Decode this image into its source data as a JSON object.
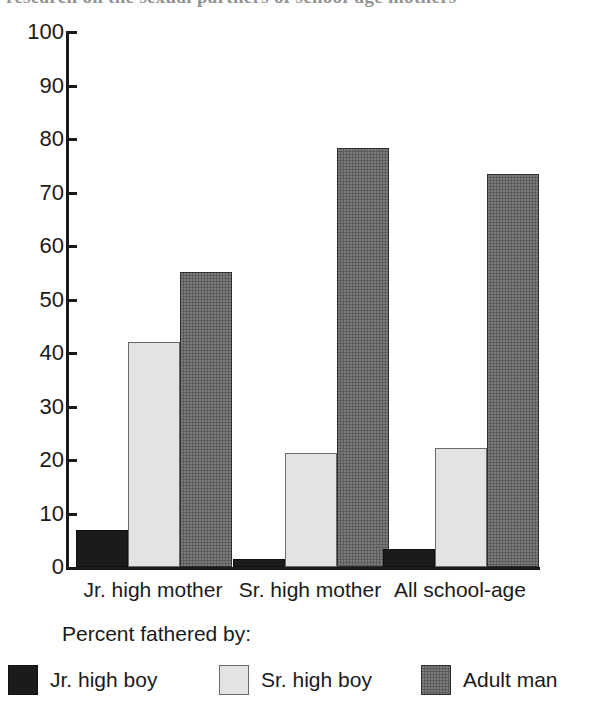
{
  "page": {
    "cut_off_title": "research on the sexual partners of school-age mothers",
    "background_color": "#ffffff"
  },
  "chart_data": {
    "type": "bar",
    "title": "",
    "xlabel": "",
    "ylabel": "",
    "categories": [
      "Jr. high mother",
      "Sr. high mother",
      "All school-age"
    ],
    "series": [
      {
        "name": "Jr. high boy",
        "color": "#1b1b1b",
        "values": [
          7.0,
          1.5,
          3.4
        ]
      },
      {
        "name": "Sr. high boy",
        "color": "#e3e3e3",
        "values": [
          42.0,
          21.3,
          22.2
        ]
      },
      {
        "name": "Adult man",
        "color": "#5c5c5c",
        "values": [
          55.2,
          78.3,
          73.4
        ]
      }
    ],
    "ylim": [
      0,
      100
    ],
    "ytick_step": 10,
    "yticks": [
      "100",
      "90",
      "80",
      "70",
      "60",
      "50",
      "40",
      "30",
      "20",
      "10",
      "0"
    ],
    "grid": false,
    "legend_position": "bottom",
    "legend_title": "Percent fathered by:"
  }
}
